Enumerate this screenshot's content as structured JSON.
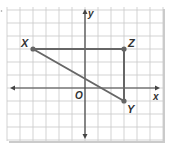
{
  "diagram": {
    "type": "coordinate-plane",
    "grid": {
      "cols": 12,
      "rows": 10,
      "cell_px": 13,
      "left": 7,
      "top": 10
    },
    "origin_cell": {
      "col": 6,
      "row": 6
    },
    "axes": {
      "x_label": "x",
      "y_label": "y",
      "origin_label": "O"
    },
    "points": [
      {
        "name": "X",
        "x": -4,
        "y": 3
      },
      {
        "name": "Z",
        "x": 3,
        "y": 3
      },
      {
        "name": "Y",
        "x": 3,
        "y": -1
      }
    ],
    "segments": [
      {
        "from": "X",
        "to": "Z"
      },
      {
        "from": "Z",
        "to": "Y"
      },
      {
        "from": "X",
        "to": "Y"
      }
    ],
    "colors": {
      "grid": "#c8c8c8",
      "axis": "#444444",
      "segment": "#666666",
      "point": "#666666",
      "shadow": "#9a9a9a"
    }
  }
}
